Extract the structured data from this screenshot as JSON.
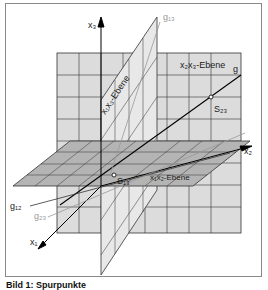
{
  "figure": {
    "axes": {
      "x1": "x₁",
      "x2": "x₂",
      "x3": "x₃"
    },
    "planes": {
      "x1x2": "x₁x₂-Ebene",
      "x1x3": "x₁x₃-Ebene",
      "x2x3": "x₂x₃-Ebene"
    },
    "lines": {
      "g": "g",
      "g12": "g₁₂",
      "g13": "g₁₃",
      "g23": "g₂₃"
    },
    "points": {
      "S13": "S₁₃",
      "S23": "S₂₃"
    },
    "colors": {
      "plane_x2x3": "#dcdcdc",
      "plane_x1x2": "#b4b4b4",
      "plane_x1x3": "#e6e6e6",
      "grid": "#333333",
      "trace_line_grey": "#9a9a9a"
    }
  },
  "caption": "Bild 1: Spurpunkte"
}
